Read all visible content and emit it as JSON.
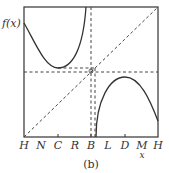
{
  "figure": {
    "caption": "(b)",
    "y_axis_label": "f(x)",
    "x_axis_label": "x",
    "x_ticks": [
      "H",
      "N",
      "C",
      "R",
      "B",
      "L",
      "D",
      "M",
      "H"
    ]
  },
  "colors": {
    "curve": "#333333",
    "dashed": "#444444",
    "frame": "#333333",
    "background": "#ffffff"
  }
}
